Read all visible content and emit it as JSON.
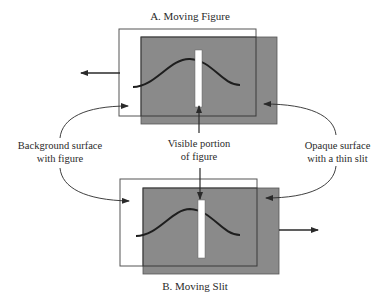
{
  "panels": {
    "a": {
      "title": "A. Moving Figure"
    },
    "b": {
      "title": "B. Moving Slit"
    }
  },
  "labels": {
    "background": {
      "line1": "Background surface",
      "line2": "with figure"
    },
    "visible": {
      "line1": "Visible portion",
      "line2": "of figure"
    },
    "opaque": {
      "line1": "Opaque surface",
      "line2": "with a thin slit"
    }
  },
  "colors": {
    "opaque_surface": "#8a8a8a",
    "outline": "#3a3a3a",
    "curve": "#1e1e1e",
    "slit": "#ffffff"
  }
}
